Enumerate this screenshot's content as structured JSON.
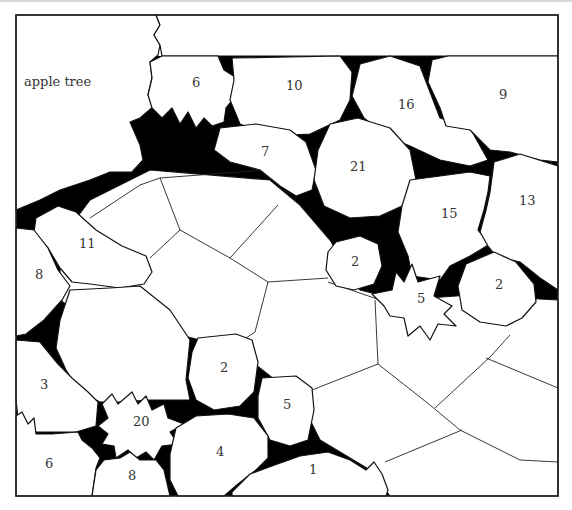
{
  "diagram": {
    "colors": {
      "background": "#ffffff",
      "outline": "#111111",
      "soil": "#000000",
      "label": "#333333"
    },
    "labels": [
      {
        "id": "apple-tree",
        "text": "apple tree"
      },
      {
        "id": "plant-6-top",
        "text": "6"
      },
      {
        "id": "plant-10",
        "text": "10"
      },
      {
        "id": "plant-16",
        "text": "16"
      },
      {
        "id": "plant-9",
        "text": "9"
      },
      {
        "id": "plant-7",
        "text": "7"
      },
      {
        "id": "plant-21",
        "text": "21"
      },
      {
        "id": "plant-15",
        "text": "15"
      },
      {
        "id": "plant-13",
        "text": "13"
      },
      {
        "id": "plant-11",
        "text": "11"
      },
      {
        "id": "plant-8-left",
        "text": "8"
      },
      {
        "id": "plant-2-mid",
        "text": "2"
      },
      {
        "id": "plant-5-star",
        "text": "5"
      },
      {
        "id": "plant-2-right",
        "text": "2"
      },
      {
        "id": "plant-3",
        "text": "3"
      },
      {
        "id": "plant-2-lower",
        "text": "2"
      },
      {
        "id": "plant-5-lower",
        "text": "5"
      },
      {
        "id": "plant-20",
        "text": "20"
      },
      {
        "id": "plant-4",
        "text": "4"
      },
      {
        "id": "plant-6-bottom",
        "text": "6"
      },
      {
        "id": "plant-8-bottom",
        "text": "8"
      },
      {
        "id": "plant-1",
        "text": "1"
      }
    ]
  }
}
